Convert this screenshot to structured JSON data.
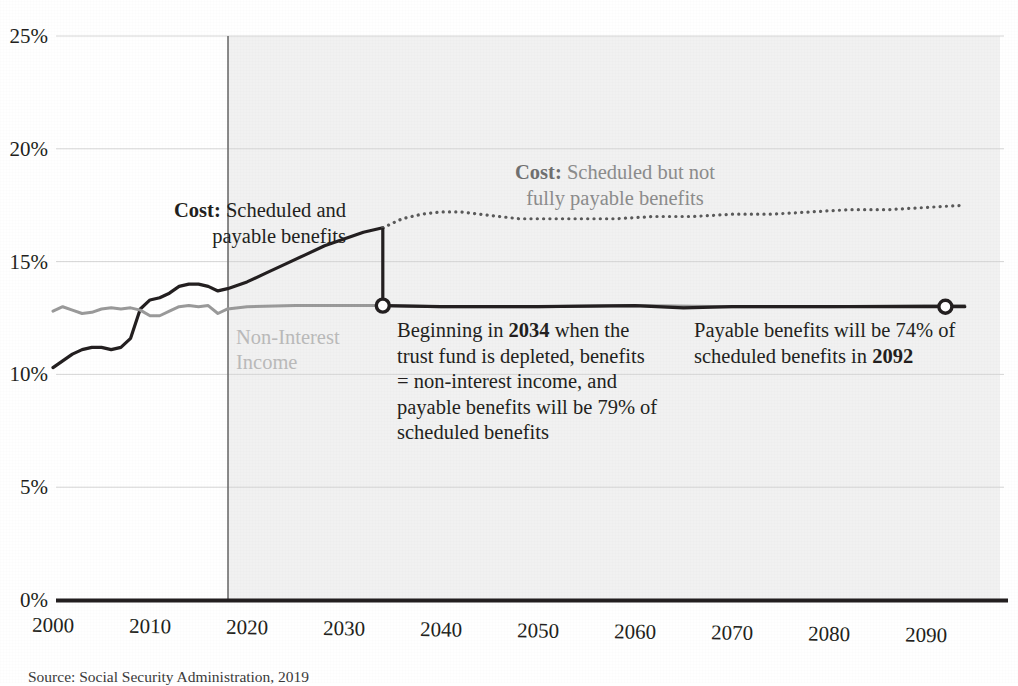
{
  "chart_data": {
    "type": "line",
    "title": "",
    "subtitle": "",
    "xlabel": "",
    "ylabel": "",
    "xlim": [
      2000,
      2095
    ],
    "ylim": [
      0,
      25
    ],
    "y_tick_labels": [
      "0%",
      "5%",
      "10%",
      "15%",
      "20%",
      "25%"
    ],
    "y_tick_values": [
      0,
      5,
      10,
      15,
      20,
      25
    ],
    "x_tick_labels": [
      "2000",
      "2010",
      "2020",
      "2030",
      "2040",
      "2050",
      "2060",
      "2070",
      "2080",
      "2090"
    ],
    "x_tick_values": [
      2000,
      2010,
      2020,
      2030,
      2040,
      2050,
      2060,
      2070,
      2080,
      2090
    ],
    "grid": "horizontal",
    "legend_position": "inline-annotations",
    "projection_start_year": 2016,
    "series": [
      {
        "name": "Cost: Scheduled and payable benefits",
        "style": "solid",
        "color": "#231f20",
        "x": [
          2000,
          2001,
          2002,
          2003,
          2004,
          2005,
          2006,
          2007,
          2008,
          2009,
          2010,
          2011,
          2012,
          2013,
          2014,
          2015,
          2016,
          2017,
          2018,
          2020,
          2022,
          2024,
          2026,
          2028,
          2030,
          2032,
          2034
        ],
        "y": [
          10.3,
          10.6,
          10.9,
          11.1,
          11.2,
          11.2,
          11.1,
          11.2,
          11.6,
          12.9,
          13.3,
          13.4,
          13.6,
          13.9,
          14.0,
          14.0,
          13.9,
          13.7,
          13.8,
          14.1,
          14.5,
          14.9,
          15.3,
          15.7,
          16.0,
          16.3,
          16.5
        ]
      },
      {
        "name": "Cost: Scheduled but not fully payable benefits",
        "style": "dotted",
        "color": "#5a5a5a",
        "x": [
          2034,
          2036,
          2038,
          2040,
          2042,
          2044,
          2046,
          2048,
          2050,
          2054,
          2058,
          2062,
          2066,
          2070,
          2074,
          2078,
          2082,
          2086,
          2090,
          2094
        ],
        "y": [
          16.5,
          16.9,
          17.1,
          17.2,
          17.2,
          17.1,
          17.0,
          16.9,
          16.9,
          16.9,
          16.9,
          17.0,
          17.0,
          17.1,
          17.1,
          17.2,
          17.3,
          17.3,
          17.4,
          17.5
        ]
      },
      {
        "name": "Non-Interest Income",
        "style": "solid",
        "color": "#9a9a9a",
        "x": [
          2000,
          2001,
          2002,
          2003,
          2004,
          2005,
          2006,
          2007,
          2008,
          2009,
          2010,
          2011,
          2012,
          2013,
          2014,
          2015,
          2016,
          2017,
          2018,
          2020,
          2025,
          2030,
          2034,
          2040,
          2050,
          2060,
          2070,
          2080,
          2090,
          2094
        ],
        "y": [
          12.8,
          13.0,
          12.85,
          12.7,
          12.75,
          12.9,
          12.95,
          12.9,
          12.95,
          12.85,
          12.6,
          12.6,
          12.8,
          13.0,
          13.05,
          13.0,
          13.05,
          12.7,
          12.9,
          13.0,
          13.05,
          13.05,
          13.05,
          13.0,
          13.0,
          13.05,
          13.0,
          13.0,
          13.05,
          13.05
        ]
      },
      {
        "name": "Payable benefits (post-depletion)",
        "style": "solid",
        "color": "#231f20",
        "x": [
          2034,
          2040,
          2050,
          2060,
          2065,
          2070,
          2080,
          2092,
          2094
        ],
        "y": [
          13.05,
          13.0,
          13.0,
          13.05,
          12.95,
          13.0,
          13.0,
          13.0,
          13.0
        ]
      }
    ],
    "markers": [
      {
        "name": "depletion-marker-2034",
        "x": 2034,
        "y": 13.05
      },
      {
        "name": "payable-marker-2092",
        "x": 2092,
        "y": 13.0
      }
    ],
    "annotations": {
      "cost_payable": {
        "line1_bold": "Cost:",
        "line1_rest": " Scheduled and",
        "line2": "payable benefits"
      },
      "cost_not_payable": {
        "line1_bold": "Cost:",
        "line1_rest": " Scheduled but not",
        "line2": "fully payable benefits"
      },
      "non_interest_income": {
        "line1": "Non-Interest",
        "line2": "Income"
      },
      "depletion_note": {
        "pre": "Beginning in ",
        "bold1": "2034",
        "mid": " when the trust fund is depleted, benefits = non-interest income, and payable benefits will be 79% of scheduled benefits"
      },
      "payable_2092_note": {
        "pre": "Payable benefits will be 74% of scheduled benefits in ",
        "bold1": "2092"
      }
    },
    "source": "Source: Social Security Administration, 2019",
    "colors": {
      "cost_solid": "#231f20",
      "cost_dotted": "#5a5a5a",
      "income": "#9a9a9a",
      "projection_shade": "#ebebeb",
      "gridline": "#d8d8d8",
      "label_light": "#b9b9b9"
    }
  }
}
